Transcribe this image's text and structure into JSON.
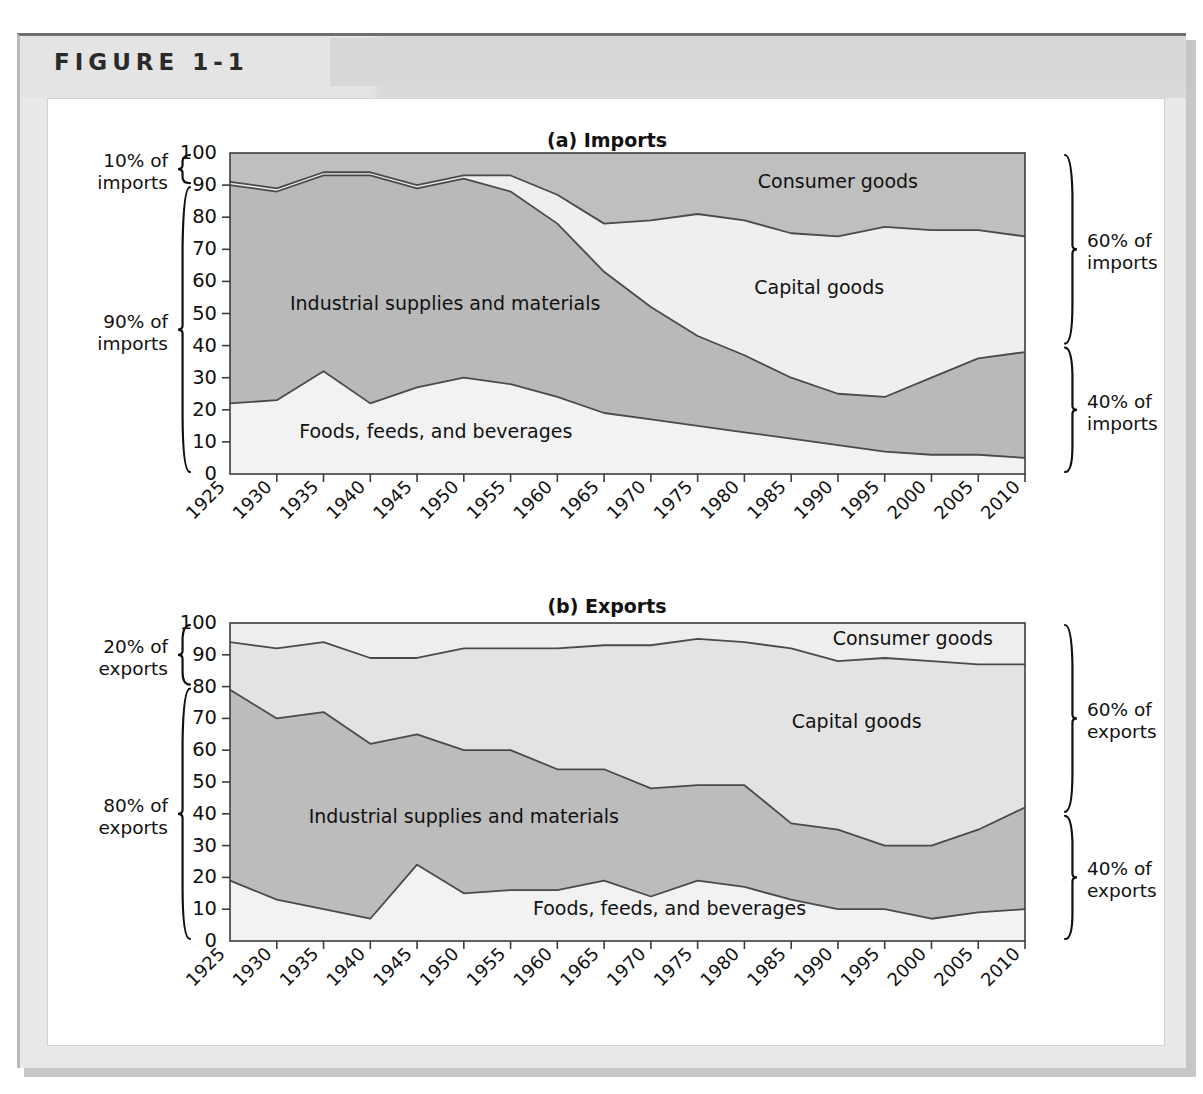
{
  "figure": {
    "label": "FIGURE 1-1"
  },
  "panels": [
    {
      "id": "imports",
      "title": "(a) Imports",
      "left_brackets": [
        {
          "line1": "10% of",
          "line2": "imports",
          "from": 100,
          "to": 90
        },
        {
          "line1": "90% of",
          "line2": "imports",
          "from": 90,
          "to": 0
        }
      ],
      "right_brackets": [
        {
          "line1": "60% of",
          "line2": "imports",
          "from": 100,
          "to": 40
        },
        {
          "line1": "40% of",
          "line2": "imports",
          "from": 40,
          "to": 0
        }
      ],
      "series_labels": [
        {
          "text": "Consumer goods",
          "x": 1990,
          "y": 91
        },
        {
          "text": "Capital goods",
          "x": 1988,
          "y": 58
        },
        {
          "text": "Industrial supplies and materials",
          "x": 1948,
          "y": 53
        },
        {
          "text": "Foods, feeds, and beverages",
          "x": 1947,
          "y": 13
        }
      ]
    },
    {
      "id": "exports",
      "title": "(b) Exports",
      "left_brackets": [
        {
          "line1": "20% of",
          "line2": "exports",
          "from": 100,
          "to": 80
        },
        {
          "line1": "80% of",
          "line2": "exports",
          "from": 80,
          "to": 0
        }
      ],
      "right_brackets": [
        {
          "line1": "60% of",
          "line2": "exports",
          "from": 100,
          "to": 40
        },
        {
          "line1": "40% of",
          "line2": "exports",
          "from": 40,
          "to": 0
        }
      ],
      "series_labels": [
        {
          "text": "Consumer goods",
          "x": 1998,
          "y": 95
        },
        {
          "text": "Capital goods",
          "x": 1992,
          "y": 69
        },
        {
          "text": "Industrial supplies and materials",
          "x": 1950,
          "y": 39
        },
        {
          "text": "Foods, feeds, and beverages",
          "x": 1972,
          "y": 10
        }
      ]
    }
  ],
  "chart_data": [
    {
      "type": "area",
      "id": "imports",
      "title": "(a) Imports",
      "stacked": true,
      "normalized": true,
      "xlabel": "",
      "ylabel": "",
      "ylim": [
        0,
        100
      ],
      "yticks": [
        0,
        10,
        20,
        30,
        40,
        50,
        60,
        70,
        80,
        90,
        100
      ],
      "grid": false,
      "legend_position": "in-plot",
      "categories": [
        1925,
        1930,
        1935,
        1940,
        1945,
        1950,
        1955,
        1960,
        1965,
        1970,
        1975,
        1980,
        1985,
        1990,
        1995,
        2000,
        2005,
        2010
      ],
      "series": [
        {
          "name": "Foods, feeds, and beverages",
          "color": "#f2f2f2",
          "values": [
            22,
            23,
            32,
            22,
            27,
            30,
            28,
            24,
            19,
            17,
            15,
            13,
            11,
            9,
            7,
            6,
            6,
            5
          ]
        },
        {
          "name": "Industrial supplies and materials",
          "color": "#b9b9b9",
          "values": [
            68,
            65,
            61,
            71,
            62,
            62,
            60,
            54,
            44,
            35,
            28,
            24,
            19,
            16,
            17,
            24,
            30,
            33
          ]
        },
        {
          "name": "Capital goods",
          "color": "#efefef",
          "values": [
            1,
            1,
            1,
            1,
            1,
            1,
            5,
            9,
            15,
            27,
            38,
            42,
            45,
            49,
            53,
            46,
            40,
            36
          ]
        },
        {
          "name": "Consumer goods",
          "color": "#bfbfbf",
          "values": [
            9,
            11,
            6,
            6,
            10,
            7,
            7,
            13,
            22,
            21,
            19,
            21,
            25,
            26,
            23,
            24,
            24,
            26
          ]
        }
      ],
      "cumulative_boundaries": {
        "foods_top": [
          22,
          23,
          32,
          22,
          27,
          30,
          28,
          24,
          19,
          17,
          15,
          13,
          11,
          9,
          7,
          6,
          6,
          5
        ],
        "industrial_top": [
          90,
          88,
          93,
          93,
          89,
          92,
          88,
          78,
          63,
          52,
          43,
          37,
          30,
          25,
          24,
          30,
          36,
          38
        ],
        "capital_top": [
          91,
          89,
          94,
          94,
          90,
          93,
          93,
          87,
          78,
          79,
          81,
          79,
          75,
          74,
          77,
          76,
          76,
          74
        ]
      }
    },
    {
      "type": "area",
      "id": "exports",
      "title": "(b) Exports",
      "stacked": true,
      "normalized": true,
      "xlabel": "",
      "ylabel": "",
      "ylim": [
        0,
        100
      ],
      "yticks": [
        0,
        10,
        20,
        30,
        40,
        50,
        60,
        70,
        80,
        90,
        100
      ],
      "grid": false,
      "legend_position": "in-plot",
      "categories": [
        1925,
        1930,
        1935,
        1940,
        1945,
        1950,
        1955,
        1960,
        1965,
        1970,
        1975,
        1980,
        1985,
        1990,
        1995,
        2000,
        2005,
        2010
      ],
      "series": [
        {
          "name": "Foods, feeds, and beverages",
          "color": "#f2f2f2",
          "values": [
            19,
            13,
            10,
            7,
            24,
            15,
            16,
            16,
            19,
            14,
            19,
            17,
            13,
            10,
            10,
            7,
            9,
            10
          ]
        },
        {
          "name": "Industrial supplies and materials",
          "color": "#bcbcbc",
          "values": [
            60,
            57,
            62,
            55,
            41,
            45,
            44,
            38,
            35,
            34,
            30,
            32,
            24,
            25,
            20,
            23,
            26,
            32
          ]
        },
        {
          "name": "Capital goods",
          "color": "#e3e3e3",
          "values": [
            15,
            22,
            22,
            27,
            24,
            32,
            32,
            38,
            39,
            45,
            46,
            45,
            55,
            53,
            59,
            58,
            52,
            45
          ]
        },
        {
          "name": "Consumer goods",
          "color": "#eeeeee",
          "values": [
            6,
            8,
            6,
            11,
            11,
            8,
            8,
            8,
            7,
            7,
            5,
            6,
            8,
            12,
            11,
            12,
            13,
            13
          ]
        }
      ],
      "cumulative_boundaries": {
        "foods_top": [
          19,
          13,
          10,
          7,
          24,
          15,
          16,
          16,
          19,
          14,
          19,
          17,
          13,
          10,
          10,
          7,
          9,
          10
        ],
        "industrial_top": [
          79,
          70,
          72,
          62,
          65,
          60,
          60,
          54,
          54,
          48,
          49,
          49,
          37,
          35,
          30,
          30,
          35,
          42
        ],
        "capital_top": [
          94,
          92,
          94,
          89,
          89,
          92,
          92,
          92,
          93,
          93,
          95,
          94,
          92,
          88,
          89,
          88,
          87,
          87
        ]
      }
    }
  ]
}
